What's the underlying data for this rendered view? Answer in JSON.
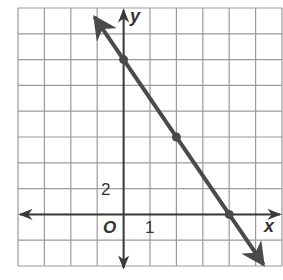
{
  "chart_data": {
    "type": "line",
    "title": "",
    "xlabel": "x",
    "ylabel": "y",
    "origin_label": "O",
    "xlim": [
      -4,
      6
    ],
    "ylim": [
      -4,
      16
    ],
    "x_grid_step": 1,
    "y_grid_step": 2,
    "grid": true,
    "tick_labels": [
      {
        "axis": "x",
        "value": 1,
        "text": "1"
      },
      {
        "axis": "y",
        "value": 2,
        "text": "2"
      }
    ],
    "series": [
      {
        "name": "line",
        "equation": "y = -3x + 12",
        "slope": -3,
        "intercept": 12,
        "points": [
          {
            "x": 0,
            "y": 12
          },
          {
            "x": 2,
            "y": 6
          },
          {
            "x": 4,
            "y": 0
          }
        ],
        "arrows": "both",
        "color": "#4a4a4a"
      }
    ]
  },
  "colors": {
    "grid": "#9a9a9a",
    "axis": "#3a3a3a",
    "line": "#4a4a4a"
  }
}
